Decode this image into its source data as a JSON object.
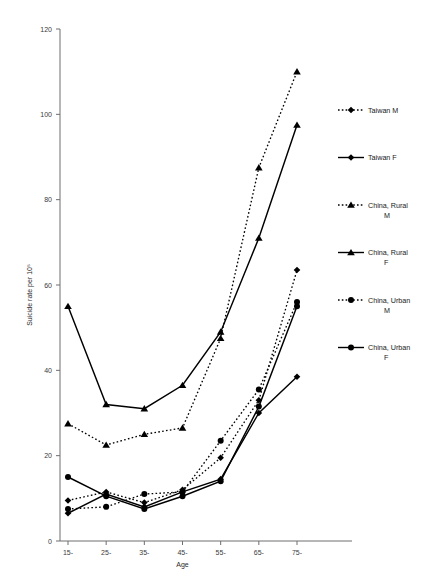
{
  "chart_data": {
    "type": "line",
    "title": "",
    "xlabel": "Age",
    "ylabel": "Suicide rate per 10⁵",
    "categories": [
      "15-",
      "25-",
      "35-",
      "45-",
      "55-",
      "65-",
      "75-"
    ],
    "xlim": [
      0,
      6
    ],
    "ylim": [
      0,
      120
    ],
    "yticks": [
      0,
      20,
      40,
      60,
      80,
      100,
      120
    ],
    "grid": false,
    "legend_position": "right",
    "series": [
      {
        "name": "Taiwan M",
        "linestyle": "dotted",
        "marker": "diamond",
        "color": "#000000",
        "values": [
          9.5,
          11.5,
          9.0,
          12.0,
          19.5,
          33.0,
          63.5
        ]
      },
      {
        "name": "Taiwan F",
        "linestyle": "solid",
        "marker": "diamond",
        "color": "#000000",
        "values": [
          6.5,
          11.0,
          8.0,
          11.5,
          14.5,
          30.0,
          38.5
        ]
      },
      {
        "name": "China, Rural M",
        "linestyle": "dotted",
        "marker": "triangle",
        "color": "#000000",
        "values": [
          27.5,
          22.5,
          25.0,
          26.5,
          47.5,
          87.5,
          110.0
        ]
      },
      {
        "name": "China, Rural F",
        "linestyle": "solid",
        "marker": "triangle",
        "color": "#000000",
        "values": [
          55.0,
          32.0,
          31.0,
          36.5,
          49.0,
          71.0,
          97.5
        ]
      },
      {
        "name": "China, Urban M",
        "linestyle": "dotted",
        "marker": "circle",
        "color": "#000000",
        "values": [
          7.5,
          8.0,
          11.0,
          11.5,
          23.5,
          35.5,
          56.0
        ]
      },
      {
        "name": "China, Urban F",
        "linestyle": "solid",
        "marker": "circle",
        "color": "#000000",
        "values": [
          15.0,
          10.5,
          7.5,
          10.5,
          14.0,
          31.5,
          55.0
        ]
      }
    ]
  },
  "legend": {
    "entries": [
      {
        "label": "Taiwan M"
      },
      {
        "label": "Taiwan F"
      },
      {
        "label": "China, Rural M"
      },
      {
        "label": "China, Rural F"
      },
      {
        "label": "China, Urban M"
      },
      {
        "label": "China, Urban F"
      }
    ]
  }
}
